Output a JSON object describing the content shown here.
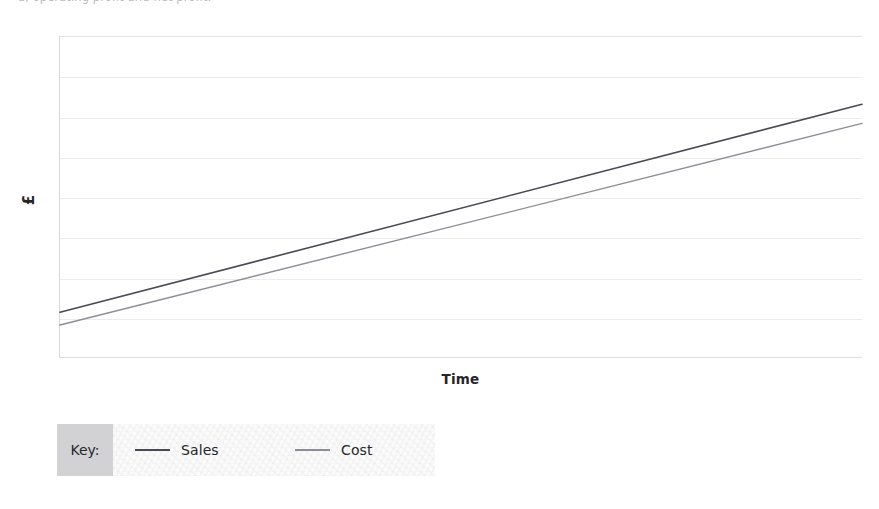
{
  "page": {
    "clipped_header_text": "a, operating profit and net profit.",
    "background_color": "#ffffff"
  },
  "chart_data": {
    "type": "line",
    "title": "",
    "subtitle": "",
    "xlabel": "Time",
    "ylabel": "£",
    "grid": true,
    "gridline_count": 7,
    "legend_position": "bottom-left",
    "legend_title": "Key:",
    "x": [
      0,
      100
    ],
    "xlim": [
      0,
      100
    ],
    "ylim": [
      0,
      100
    ],
    "axis_tick_labels": {
      "x": [],
      "y": []
    },
    "series": [
      {
        "name": "Sales",
        "color": "#4a4a52",
        "x": [
          0,
          100
        ],
        "values": [
          14,
          79
        ],
        "line_width": 1.6
      },
      {
        "name": "Cost",
        "color": "#8d8d95",
        "x": [
          0,
          100
        ],
        "values": [
          10,
          73
        ],
        "line_width": 1.4
      }
    ],
    "annotations": []
  },
  "axes": {
    "y_title": "£",
    "x_title": "Time"
  },
  "legend": {
    "key_label": "Key:",
    "entries": [
      {
        "label": "Sales",
        "color": "#4a4a52"
      },
      {
        "label": "Cost",
        "color": "#8d8d95"
      }
    ]
  },
  "colors": {
    "sales_line": "#4a4a52",
    "cost_line": "#8d8d95",
    "gridline": "#ececed",
    "axis_frame": "#d8d8dc",
    "key_box_background": "#d2d2d4",
    "text": "#25252a"
  }
}
